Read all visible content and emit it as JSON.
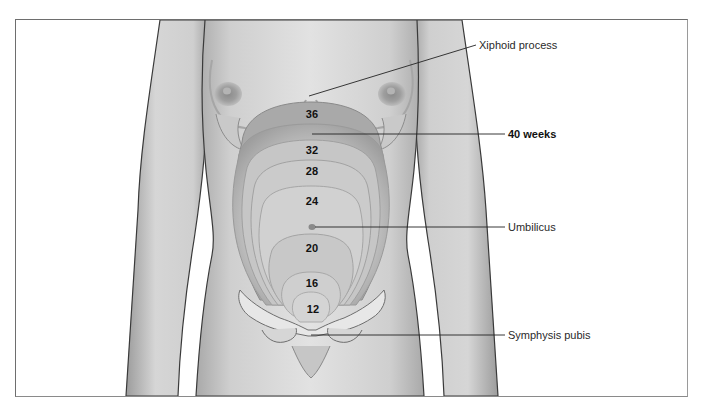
{
  "figure": {
    "week_markers": [
      {
        "label": "36",
        "x": 312,
        "y": 114
      },
      {
        "label": "32",
        "x": 312,
        "y": 150
      },
      {
        "label": "28",
        "x": 312,
        "y": 171
      },
      {
        "label": "24",
        "x": 312,
        "y": 201
      },
      {
        "label": "20",
        "x": 312,
        "y": 248
      },
      {
        "label": "16",
        "x": 312,
        "y": 283
      },
      {
        "label": "12",
        "x": 313,
        "y": 309
      }
    ],
    "callouts": [
      {
        "label": "Xiphoid process",
        "bold": false,
        "text_x": 479,
        "text_y": 45
      },
      {
        "label": "40 weeks",
        "bold": true,
        "text_x": 508,
        "text_y": 134
      },
      {
        "label": "Umbilicus",
        "bold": false,
        "text_x": 508,
        "text_y": 227
      },
      {
        "label": "Symphysis pubis",
        "bold": false,
        "text_x": 508,
        "text_y": 335
      }
    ],
    "colors": {
      "frame_border": "#6e6e6e",
      "skin_light": "#dcdcdc",
      "skin_mid": "#c4c4c4",
      "skin_shadow": "#9a9a9a",
      "outline": "#3a3a3a",
      "uterus_light": "#d2d2d2",
      "uterus_dark": "#a8a8a8",
      "bone": "#e6e6e6",
      "leader_line": "#222222"
    }
  }
}
